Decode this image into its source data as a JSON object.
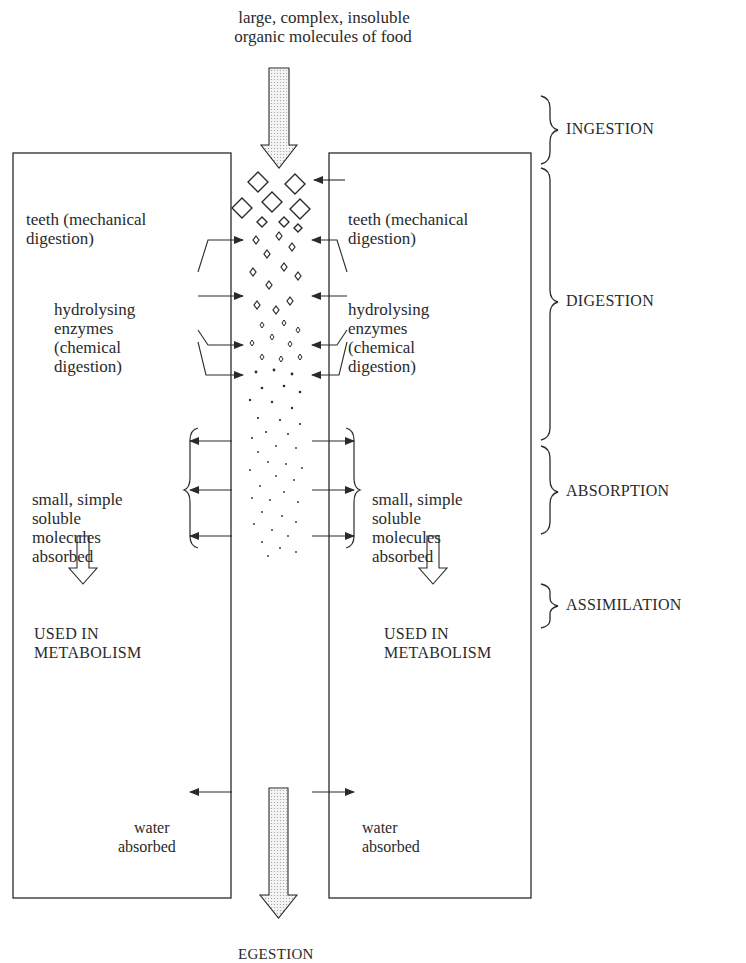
{
  "diagram": {
    "type": "flow-diagram",
    "top_label": {
      "line1": "large, complex, insoluble",
      "line2": "organic molecules of food"
    },
    "bottom_label": {
      "line1": "EGESTION",
      "line2": "of faeces"
    },
    "left_panel": {
      "teeth": [
        "teeth (mechanical",
        "digestion)"
      ],
      "enzymes": [
        "hydrolysing",
        "enzymes",
        "(chemical",
        "digestion)"
      ],
      "absorbed": [
        "small, simple",
        "soluble",
        "molecules",
        "absorbed"
      ],
      "used": [
        "USED IN",
        "METABOLISM"
      ],
      "water": [
        "water",
        "absorbed"
      ]
    },
    "right_panel": {
      "teeth": [
        "teeth (mechanical",
        "digestion)"
      ],
      "enzymes": [
        "hydrolysing",
        "enzymes",
        "(chemical",
        "digestion)"
      ],
      "absorbed": [
        "small, simple",
        "soluble",
        "molecules",
        "absorbed"
      ],
      "used": [
        "USED IN",
        "METABOLISM"
      ],
      "water": [
        "water",
        "absorbed"
      ]
    },
    "stages": [
      {
        "name": "INGESTION"
      },
      {
        "name": "DIGESTION"
      },
      {
        "name": "ABSORPTION"
      },
      {
        "name": "ASSIMILATION"
      }
    ],
    "colors": {
      "line": "#2a2a2a",
      "arrow_fill": "#e8e8e8",
      "background": "#ffffff"
    }
  }
}
